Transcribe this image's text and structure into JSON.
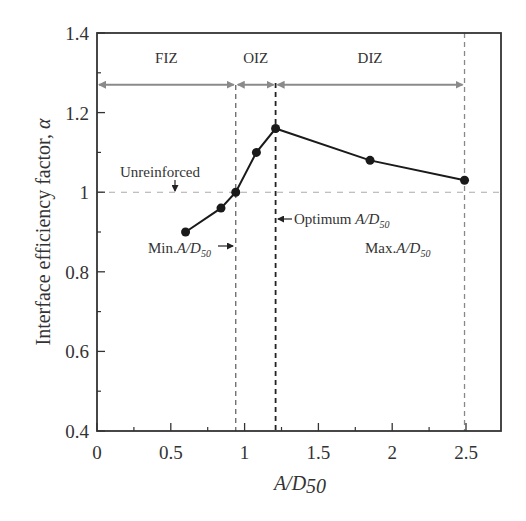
{
  "chart_data": {
    "type": "line",
    "title": "",
    "xlabel": "A/D50",
    "ylabel": "Interface efficiency factor, α",
    "xlim": [
      0,
      2.75
    ],
    "ylim": [
      0.4,
      1.4
    ],
    "x_ticks": [
      0,
      0.5,
      1,
      1.5,
      2,
      2.5
    ],
    "x_tick_labels": [
      "0",
      "0.5",
      "1",
      "1.5",
      "2",
      "2.5"
    ],
    "x_minor_ticks": [
      0.25,
      0.75,
      1.25,
      1.75,
      2.25
    ],
    "y_ticks": [
      0.4,
      0.6,
      0.8,
      1.0,
      1.2,
      1.4
    ],
    "y_tick_labels": [
      "0.4",
      "0.6",
      "0.8",
      "1",
      "1.2",
      "1.4"
    ],
    "y_minor_ticks": [
      0.5,
      0.7,
      0.9,
      1.1,
      1.3
    ],
    "grid": false,
    "legend": null,
    "series": [
      {
        "name": "Interface efficiency factor",
        "x": [
          0.6,
          0.84,
          0.94,
          1.08,
          1.21,
          1.85,
          2.49
        ],
        "y": [
          0.9,
          0.96,
          1.0,
          1.1,
          1.16,
          1.08,
          1.03
        ],
        "color": "#1a1a1a",
        "marker": "filled-circle"
      }
    ],
    "reference_lines": {
      "unreinforced_y": 1.0,
      "min_x": 0.94,
      "optimum_x": 1.21,
      "max_x": 2.49
    },
    "zones": [
      {
        "label": "FIZ",
        "x_start": 0,
        "x_end": 0.94
      },
      {
        "label": "OIZ",
        "x_start": 0.94,
        "x_end": 1.21
      },
      {
        "label": "DIZ",
        "x_start": 1.21,
        "x_end": 2.49
      }
    ],
    "zone_arrow_y": 1.27,
    "annotations": [
      {
        "id": "unreinforced",
        "text": "Unreinforced"
      },
      {
        "id": "min",
        "text": "Min.",
        "var": "A/D",
        "sub": "50"
      },
      {
        "id": "optimum",
        "text": "Optimum ",
        "var": "A/D",
        "sub": "50"
      },
      {
        "id": "max",
        "text": "Max.",
        "var": "A/D",
        "sub": "50"
      }
    ]
  },
  "labels": {
    "xlabel_main": "A/D",
    "xlabel_sub": "50",
    "ylabel_main": "Interface efficiency factor, ",
    "ylabel_symbol": "α"
  }
}
